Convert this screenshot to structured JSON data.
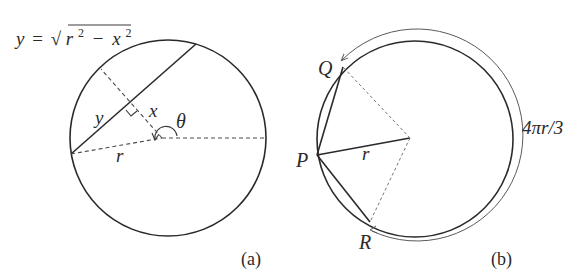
{
  "figure_a": {
    "formula_lhs": "y",
    "formula_eq": "=",
    "formula_sqrt": "√",
    "formula_r": "r",
    "formula_r_exp": "2",
    "formula_minus": "−",
    "formula_x": "x",
    "formula_x_exp": "2",
    "label_y": "y",
    "label_x": "x",
    "label_theta": "θ",
    "label_r": "r",
    "caption": "(a)"
  },
  "figure_b": {
    "point_q": "Q",
    "point_p": "P",
    "point_r": "R",
    "label_r": "r",
    "arc_length_label": "4πr/3",
    "caption": "(b)"
  },
  "colors": {
    "ink": "#2a2a2a",
    "background": "#ffffff"
  }
}
